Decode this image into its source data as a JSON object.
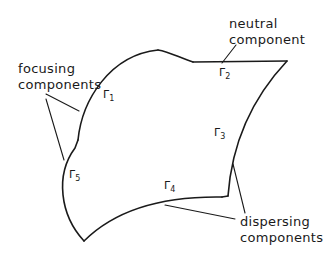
{
  "diagram": {
    "annotations": {
      "focusing": {
        "line1": "focusing",
        "line2": "components"
      },
      "neutral": {
        "line1": "neutral",
        "line2": "component"
      },
      "dispersing": {
        "line1": "dispersing",
        "line2": "components"
      }
    },
    "boundary_labels": [
      {
        "symbol": "Γ",
        "sub": "1"
      },
      {
        "symbol": "Γ",
        "sub": "2"
      },
      {
        "symbol": "Γ",
        "sub": "3"
      },
      {
        "symbol": "Γ",
        "sub": "4"
      },
      {
        "symbol": "Γ",
        "sub": "5"
      }
    ],
    "colors": {
      "stroke": "#1a1a1a",
      "background": "#ffffff"
    }
  }
}
